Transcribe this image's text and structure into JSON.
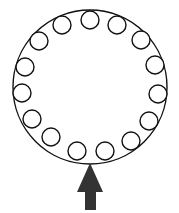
{
  "diagram": {
    "title": "",
    "stroke_color": "#111111",
    "arrow_color": "#333333",
    "outer_circle": {
      "cx": 90,
      "cy": 87,
      "r": 77
    },
    "small_circle_radius": 9,
    "small_circles": [
      {
        "cx": 90,
        "cy": 20
      },
      {
        "cx": 117,
        "cy": 25
      },
      {
        "cx": 141,
        "cy": 40
      },
      {
        "cx": 155,
        "cy": 65
      },
      {
        "cx": 158,
        "cy": 94
      },
      {
        "cx": 149,
        "cy": 121
      },
      {
        "cx": 131,
        "cy": 141
      },
      {
        "cx": 105,
        "cy": 151
      },
      {
        "cx": 77,
        "cy": 151
      },
      {
        "cx": 51,
        "cy": 137
      },
      {
        "cx": 32,
        "cy": 119
      },
      {
        "cx": 22,
        "cy": 93
      },
      {
        "cx": 25,
        "cy": 67
      },
      {
        "cx": 39,
        "cy": 41
      },
      {
        "cx": 62,
        "cy": 25
      }
    ],
    "small_circle_count": 15,
    "arrow": {
      "direction": "up",
      "tip": [
        90,
        163
      ],
      "head_left": [
        77,
        192
      ],
      "head_right": [
        103,
        192
      ],
      "shaft_left": 85,
      "shaft_right": 96,
      "shaft_bottom": 210
    }
  }
}
